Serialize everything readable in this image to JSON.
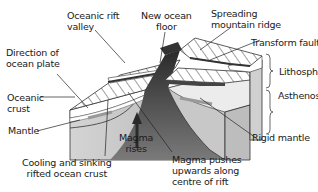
{
  "diagram": {
    "type": "block-diagram",
    "labels": {
      "oceanic_rift_valley": [
        "Oceanic rift",
        "valley"
      ],
      "new_ocean_floor": [
        "New ocean",
        "floor"
      ],
      "spreading_ridge": [
        "Spreading",
        "mountain ridge"
      ],
      "transform_fault": "Transform fault",
      "direction_plate": [
        "Direction of",
        "ocean plate"
      ],
      "lithosphere": "Lithosphere",
      "oceanic_crust": [
        "Oceanic",
        "crust"
      ],
      "asthenosphere": "Asthenosphere",
      "mantle": "Mantle",
      "magma_rises": [
        "Magma",
        "rises"
      ],
      "rigid_mantle": "Rigid mantle",
      "cooling": [
        "Cooling and sinking",
        "rifted ocean crust"
      ],
      "magma_pushes": [
        "Magma pushes",
        "upwards along",
        "centre of rift"
      ]
    },
    "colors": {
      "crust_top": "#ffffff",
      "hatch": "#333333",
      "mantle": "#c8c8c8",
      "asthenosphere": "#e6e6e6",
      "magma_dark": "#3a3a3a",
      "plate_arrow": "#9a9a9a"
    }
  }
}
